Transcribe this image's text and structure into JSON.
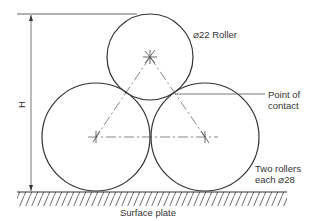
{
  "diagram": {
    "labels": {
      "top_roller": "⌀22 Roller",
      "point_of_contact_line1": "Point of",
      "point_of_contact_line2": "contact",
      "two_rollers_line1": "Two rollers",
      "two_rollers_line2": "each ⌀28",
      "surface_plate": "Surface plate",
      "dimension": "H"
    },
    "rollers": [
      {
        "name": "top-roller",
        "diameter": 22
      },
      {
        "name": "left-bottom-roller",
        "diameter": 28
      },
      {
        "name": "right-bottom-roller",
        "diameter": 28
      }
    ],
    "colors": {
      "line": "#333333",
      "thin_line": "#555555",
      "background": "#ffffff"
    }
  }
}
